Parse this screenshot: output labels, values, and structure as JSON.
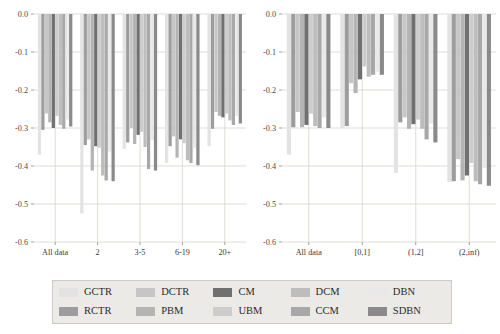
{
  "figure": {
    "background": "#ffffff",
    "panel_background": "#ffffff",
    "grid_color": "#d9d4cc",
    "axis_color": "#8a8a8a"
  },
  "legend": {
    "background": "#eceae6",
    "border": "#cfcbc4",
    "order": [
      "GCTR",
      "RCTR",
      "DCTR",
      "PBM",
      "CM",
      "UBM",
      "DCM",
      "CCM",
      "DBN",
      "SDBN"
    ],
    "items": [
      {
        "label": "GCTR",
        "color": "#e3e3e3"
      },
      {
        "label": "RCTR",
        "color": "#9d9d9d"
      },
      {
        "label": "DCTR",
        "color": "#c6c6c6"
      },
      {
        "label": "PBM",
        "color": "#b4b4b4"
      },
      {
        "label": "CM",
        "color": "#707070"
      },
      {
        "label": "UBM",
        "color": "#cdcdcd"
      },
      {
        "label": "DCM",
        "color": "#bdbdbd"
      },
      {
        "label": "CCM",
        "color": "#a8a8a8"
      },
      {
        "label": "DBN",
        "color": "#e9e9e9"
      },
      {
        "label": "SDBN",
        "color": "#8a8a8a"
      }
    ]
  },
  "chart_data": {
    "type": "bar",
    "title": "",
    "xlabel": "",
    "ylabel": "",
    "ylim": [
      -0.6,
      0.0
    ],
    "yticks": [
      0.0,
      -0.1,
      -0.2,
      -0.3,
      -0.4,
      -0.5,
      -0.6
    ],
    "ytick_labels": [
      "0.0",
      "-0.1",
      "-0.2",
      "-0.3",
      "-0.4",
      "-0.5",
      "-0.6"
    ],
    "grid": true,
    "legend_position": "bottom",
    "orientation": "vertical-downward",
    "series_names": [
      "GCTR",
      "RCTR",
      "DCTR",
      "PBM",
      "CM",
      "UBM",
      "DCM",
      "CCM",
      "DBN",
      "SDBN"
    ],
    "panels": [
      {
        "name": "left",
        "xlabel": "",
        "categories": [
          "All data",
          "2",
          "3-5",
          "6-19",
          "20+"
        ],
        "series": [
          {
            "name": "GCTR",
            "values": [
              -0.37,
              -0.525,
              -0.355,
              -0.392,
              -0.348
            ]
          },
          {
            "name": "RCTR",
            "values": [
              -0.305,
              -0.345,
              -0.338,
              -0.348,
              -0.302
            ]
          },
          {
            "name": "DCTR",
            "values": [
              -0.262,
              -0.33,
              -0.3,
              -0.322,
              -0.258
            ]
          },
          {
            "name": "PBM",
            "values": [
              -0.285,
              -0.412,
              -0.342,
              -0.378,
              -0.268
            ]
          },
          {
            "name": "CM",
            "values": [
              -0.3,
              -0.348,
              -0.318,
              -0.33,
              -0.272
            ]
          },
          {
            "name": "UBM",
            "values": [
              -0.268,
              -0.352,
              -0.31,
              -0.34,
              -0.262
            ]
          },
          {
            "name": "DCM",
            "values": [
              -0.292,
              -0.425,
              -0.35,
              -0.385,
              -0.28
            ]
          },
          {
            "name": "CCM",
            "values": [
              -0.302,
              -0.438,
              -0.408,
              -0.392,
              -0.292
            ]
          },
          {
            "name": "DBN",
            "values": [
              -0.278,
              -0.362,
              -0.332,
              -0.352,
              -0.268
            ]
          },
          {
            "name": "SDBN",
            "values": [
              -0.296,
              -0.44,
              -0.412,
              -0.398,
              -0.288
            ]
          }
        ]
      },
      {
        "name": "right",
        "xlabel": "",
        "categories": [
          "All data",
          "[0,1]",
          "(1,2]",
          "(2,inf)"
        ],
        "series": [
          {
            "name": "GCTR",
            "values": [
              -0.37,
              -0.3,
              -0.418,
              -0.442
            ]
          },
          {
            "name": "RCTR",
            "values": [
              -0.298,
              -0.295,
              -0.285,
              -0.44
            ]
          },
          {
            "name": "DCTR",
            "values": [
              -0.258,
              -0.182,
              -0.272,
              -0.382
            ]
          },
          {
            "name": "PBM",
            "values": [
              -0.298,
              -0.208,
              -0.302,
              -0.438
            ]
          },
          {
            "name": "CM",
            "values": [
              -0.292,
              -0.172,
              -0.29,
              -0.425
            ]
          },
          {
            "name": "UBM",
            "values": [
              -0.262,
              -0.138,
              -0.278,
              -0.392
            ]
          },
          {
            "name": "DCM",
            "values": [
              -0.295,
              -0.165,
              -0.302,
              -0.44
            ]
          },
          {
            "name": "CCM",
            "values": [
              -0.3,
              -0.16,
              -0.33,
              -0.448
            ]
          },
          {
            "name": "DBN",
            "values": [
              -0.272,
              -0.152,
              -0.288,
              -0.405
            ]
          },
          {
            "name": "SDBN",
            "values": [
              -0.3,
              -0.16,
              -0.338,
              -0.452
            ]
          }
        ]
      }
    ]
  }
}
